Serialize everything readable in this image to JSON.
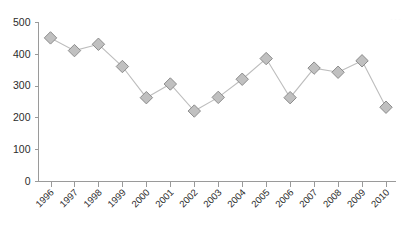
{
  "chart_data": {
    "type": "line",
    "title": "",
    "subtitle": "",
    "xlabel": "",
    "ylabel": "",
    "categories": [
      "1996",
      "1997",
      "1998",
      "1999",
      "2000",
      "2001",
      "2002",
      "2003",
      "2004",
      "2005",
      "2006",
      "2007",
      "2008",
      "2009",
      "2010"
    ],
    "values": [
      450,
      410,
      430,
      360,
      262,
      305,
      220,
      263,
      320,
      385,
      262,
      355,
      342,
      378,
      232
    ],
    "series": [
      {
        "name": "series-1",
        "values": [
          450,
          410,
          430,
          360,
          262,
          305,
          220,
          263,
          320,
          385,
          262,
          355,
          342,
          378,
          232
        ]
      }
    ],
    "ylim": [
      0,
      500
    ],
    "yticks": [
      0,
      100,
      200,
      300,
      400,
      500
    ],
    "ytick_labels": [
      "0",
      "100",
      "200",
      "300",
      "400",
      "500"
    ],
    "xtick_labels": [
      "1996",
      "1997",
      "1998",
      "1999",
      "2000",
      "2001",
      "2002",
      "2003",
      "2004",
      "2005",
      "2006",
      "2007",
      "2008",
      "2009",
      "2010"
    ],
    "xtick_rotation_deg": -45,
    "grid": false,
    "legend": false,
    "legend_position": "none",
    "marker_shape": "diamond",
    "colors": {
      "line": "#bdbdbd",
      "marker_fill": "#c0c0c0",
      "marker_stroke": "#8c8c8c",
      "axis": "#9a9a9a",
      "text": "#2b2b2b",
      "background": "#ffffff"
    }
  },
  "watermark": {
    "text": "···"
  }
}
